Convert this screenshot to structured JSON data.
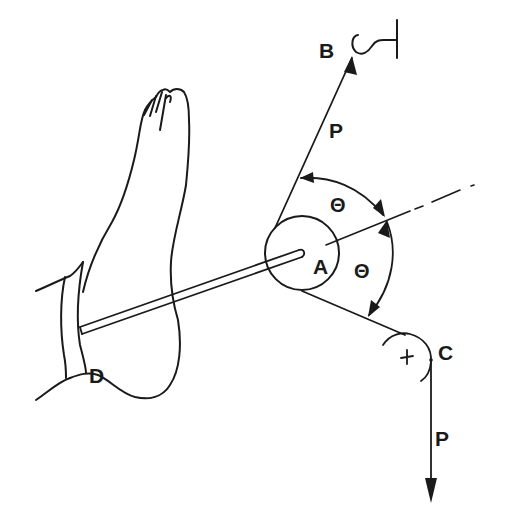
{
  "figure": {
    "labels": {
      "point_a": "A",
      "point_b": "B",
      "point_c": "C",
      "point_d": "D",
      "force_upper": "P",
      "force_lower": "P",
      "angle_upper": "Θ",
      "angle_lower": "Θ"
    },
    "elements": {
      "anchor": "hook attached to fixed support at B",
      "pulley_a": "circular pulley at A",
      "pulley_c": "pulley at C with center marked +",
      "rod": "rod from D on the foot to A",
      "axis": "dash-dot bisector axis through A",
      "foot": "outline of foot with strap"
    },
    "colors": {
      "ink": "#1a1a1a",
      "background": "#ffffff"
    }
  }
}
